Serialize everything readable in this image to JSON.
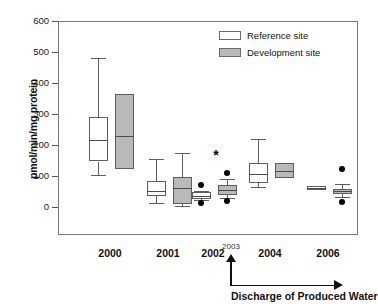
{
  "chart_data": {
    "type": "box",
    "title": "",
    "xlabel": "Discharge of Produced Water",
    "ylabel": "pmol/min/mg protein",
    "ylim": [
      0,
      600
    ],
    "yticks": [
      0,
      100,
      200,
      300,
      400,
      500,
      600
    ],
    "ytick_labels": [
      "0",
      "100",
      "200",
      "300",
      "400",
      "500",
      "600"
    ],
    "grid": false,
    "categories": [
      "2000",
      "2001",
      "2002",
      "2004",
      "2006"
    ],
    "legend_position": "top-right",
    "legend": [
      "Reference site",
      "Development site"
    ],
    "series": [
      {
        "name": "Reference site",
        "fill": "#ffffff",
        "boxes": [
          {
            "category": "2000",
            "whisker_low": 105,
            "q1": 150,
            "median": 218,
            "q3": 295,
            "whisker_high": 483,
            "outliers": []
          },
          {
            "category": "2001",
            "whisker_low": 17,
            "q1": 38,
            "median": 55,
            "q3": 86,
            "whisker_high": 157,
            "outliers": []
          },
          {
            "category": "2002",
            "whisker_low": 25,
            "q1": 30,
            "median": 40,
            "q3": 52,
            "whisker_high": 56,
            "outliers": [
              73,
              15
            ]
          },
          {
            "category": "2004",
            "whisker_low": 68,
            "q1": 80,
            "median": 110,
            "q3": 145,
            "whisker_high": 221,
            "outliers": []
          },
          {
            "category": "2006",
            "whisker_low": 58,
            "q1": 58,
            "median": 64,
            "q3": 72,
            "whisker_high": 72,
            "outliers": []
          }
        ]
      },
      {
        "name": "Development site",
        "fill": "#b9b9b9",
        "boxes": [
          {
            "category": "2000",
            "whisker_low": 127,
            "q1": 127,
            "median": 231,
            "q3": 367,
            "whisker_high": 367,
            "outliers": []
          },
          {
            "category": "2001",
            "whisker_low": 5,
            "q1": 13,
            "median": 64,
            "q3": 100,
            "whisker_high": 177,
            "outliers": []
          },
          {
            "category": "2002",
            "whisker_low": 33,
            "q1": 43,
            "median": 58,
            "q3": 74,
            "whisker_high": 94,
            "outliers": [
              114,
              22
            ]
          },
          {
            "category": "2004",
            "whisker_low": 97,
            "q1": 97,
            "median": 120,
            "q3": 146,
            "whisker_high": 146,
            "outliers": []
          },
          {
            "category": "2006",
            "whisker_low": 36,
            "q1": 44,
            "median": 55,
            "q3": 62,
            "whisker_high": 78,
            "outliers": [
              127,
              18
            ]
          }
        ]
      }
    ],
    "annotations": [
      {
        "text": "*",
        "category": "2002",
        "value": 172
      },
      {
        "text": "2003",
        "type": "event-arrow",
        "description": "Discharge of Produced Water begins"
      }
    ]
  },
  "axis": {
    "y_title": "pmol/min/mg protein",
    "x_event_label": "2003",
    "x_caption": "Discharge of Produced Water"
  },
  "legend": {
    "items": [
      {
        "label": "Reference site",
        "color": "#ffffff"
      },
      {
        "label": "Development site",
        "color": "#b9b9b9"
      }
    ]
  }
}
